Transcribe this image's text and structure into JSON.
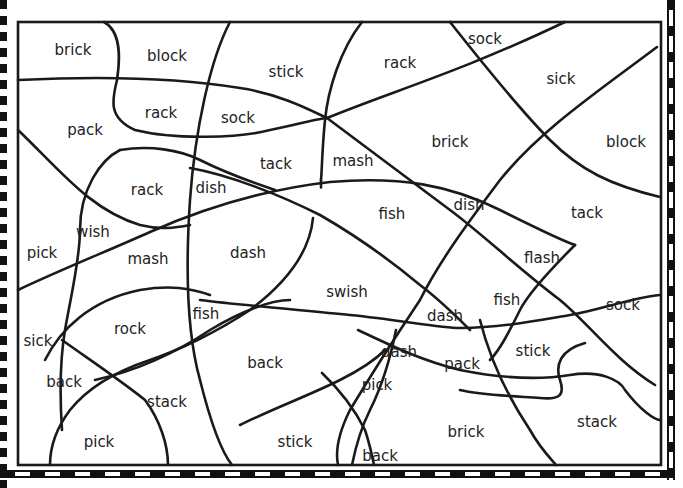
{
  "worksheet": {
    "type": "color-by-word puzzle",
    "words": [
      {
        "text": "brick",
        "x": 73,
        "y": 55
      },
      {
        "text": "block",
        "x": 167,
        "y": 61
      },
      {
        "text": "stick",
        "x": 286,
        "y": 77
      },
      {
        "text": "rack",
        "x": 400,
        "y": 68
      },
      {
        "text": "sock",
        "x": 485,
        "y": 44
      },
      {
        "text": "sick",
        "x": 561,
        "y": 84
      },
      {
        "text": "rack",
        "x": 161,
        "y": 118
      },
      {
        "text": "sock",
        "x": 238,
        "y": 123
      },
      {
        "text": "pack",
        "x": 85,
        "y": 135
      },
      {
        "text": "brick",
        "x": 450,
        "y": 147
      },
      {
        "text": "block",
        "x": 626,
        "y": 147
      },
      {
        "text": "tack",
        "x": 276,
        "y": 169
      },
      {
        "text": "mash",
        "x": 353,
        "y": 166
      },
      {
        "text": "rack",
        "x": 147,
        "y": 195
      },
      {
        "text": "dish",
        "x": 211,
        "y": 193
      },
      {
        "text": "fish",
        "x": 392,
        "y": 219
      },
      {
        "text": "dish",
        "x": 469,
        "y": 210
      },
      {
        "text": "tack",
        "x": 587,
        "y": 218
      },
      {
        "text": "wish",
        "x": 93,
        "y": 237
      },
      {
        "text": "pick",
        "x": 42,
        "y": 258
      },
      {
        "text": "mash",
        "x": 148,
        "y": 264
      },
      {
        "text": "dash",
        "x": 248,
        "y": 258
      },
      {
        "text": "flash",
        "x": 542,
        "y": 263
      },
      {
        "text": "swish",
        "x": 347,
        "y": 297
      },
      {
        "text": "fish",
        "x": 507,
        "y": 305
      },
      {
        "text": "sock",
        "x": 623,
        "y": 310
      },
      {
        "text": "fish",
        "x": 206,
        "y": 319
      },
      {
        "text": "dash",
        "x": 445,
        "y": 321
      },
      {
        "text": "rock",
        "x": 130,
        "y": 334
      },
      {
        "text": "sick",
        "x": 38,
        "y": 346
      },
      {
        "text": "dash",
        "x": 399,
        "y": 357
      },
      {
        "text": "pack",
        "x": 462,
        "y": 369
      },
      {
        "text": "stick",
        "x": 533,
        "y": 356
      },
      {
        "text": "back",
        "x": 265,
        "y": 368
      },
      {
        "text": "back",
        "x": 64,
        "y": 387
      },
      {
        "text": "pick",
        "x": 377,
        "y": 390
      },
      {
        "text": "stack",
        "x": 167,
        "y": 407
      },
      {
        "text": "brick",
        "x": 466,
        "y": 437
      },
      {
        "text": "stack",
        "x": 597,
        "y": 427
      },
      {
        "text": "pick",
        "x": 99,
        "y": 447
      },
      {
        "text": "stick",
        "x": 295,
        "y": 447
      },
      {
        "text": "back",
        "x": 380,
        "y": 461
      }
    ]
  }
}
